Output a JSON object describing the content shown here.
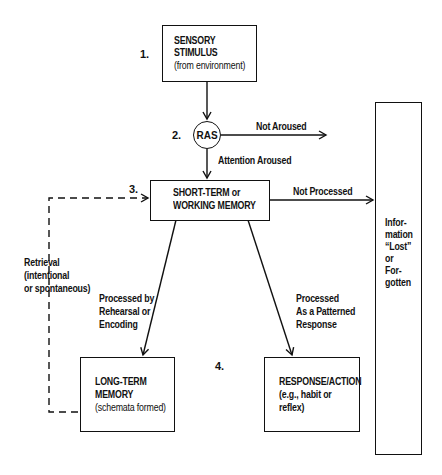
{
  "diagram": {
    "steps": [
      "1.",
      "2.",
      "3.",
      "4."
    ],
    "nodes": {
      "sensory": {
        "line1": "SENSORY",
        "line2": "STIMULUS",
        "line3": "(from environment)"
      },
      "ras": {
        "label": "RAS"
      },
      "stm": {
        "line1": "SHORT-TERM or",
        "line2": "WORKING MEMORY"
      },
      "ltm": {
        "line1": "LONG-TERM",
        "line2": "MEMORY",
        "line3": "(schemata formed)"
      },
      "response": {
        "line1": "RESPONSE/ACTION",
        "line2": "(e.g., habit or",
        "line3": "reflex)"
      },
      "lost": {
        "line1": "Infor-",
        "line2": "mation",
        "line3": "“Lost”",
        "line4": "or",
        "line5": "For-",
        "line6": "gotten"
      }
    },
    "edges": {
      "not_aroused": "Not Aroused",
      "attention_aroused": "Attention Aroused",
      "not_processed": "Not Processed",
      "rehearsal": {
        "line1": "Processed by",
        "line2": "Rehearsal or",
        "line3": "Encoding"
      },
      "patterned": {
        "line1": "Processed",
        "line2": "As a Patterned",
        "line3": "Response"
      },
      "retrieval": {
        "line1": "Retrieval",
        "line2": "(intentional",
        "line3": "or spontaneous)"
      }
    }
  }
}
